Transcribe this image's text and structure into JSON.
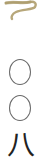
{
  "document": {
    "page_number_text": "〇〇八",
    "characters": [
      {
        "char": "〇",
        "meaning": "zero"
      },
      {
        "char": "〇",
        "meaning": "zero"
      },
      {
        "char": "八",
        "meaning": "eight"
      }
    ],
    "ornament": {
      "icon": "brush-swirl-icon",
      "color": "#b7a77a"
    },
    "text_color": "#3a3a3a"
  }
}
